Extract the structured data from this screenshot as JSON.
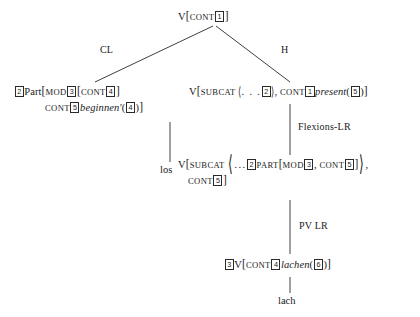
{
  "diagram": {
    "nodes": {
      "root": {
        "id": "root",
        "label": "V[CONT 1]",
        "parts": {
          "cat": "V",
          "open_bracket": "[",
          "cont_label": "CONT",
          "cont_index": "1",
          "close_bracket": "]"
        }
      },
      "left_particle": {
        "id": "left-particle",
        "label": "2 Part[MOD 3 [CONT 4 ] CONT 5 beginnen'(4)]",
        "parts": {
          "index": "2",
          "cat": "Part",
          "open_bracket": "[",
          "mod_label": "MOD",
          "mod_index": "3",
          "inner_open": "[",
          "inner_cont_label": "CONT",
          "inner_cont_index": "4",
          "inner_close": "]",
          "cont_label": "CONT",
          "cont_index": "5",
          "relation": "beginnen'",
          "arg_open": "(",
          "arg_index": "4",
          "arg_close": ")",
          "close_bracket": "]"
        }
      },
      "right_head": {
        "id": "right-head",
        "label": "V[SUBCAT ⟨ . . . 2 ⟩, CONT 1 present(5)]",
        "parts": {
          "cat": "V",
          "open_bracket": "[",
          "subcat_label": "SUBCAT",
          "angle_open": "⟨",
          "ellipsis": ". . .",
          "elem_index": "2",
          "angle_close": "⟩",
          "comma": ",",
          "cont_label": "CONT",
          "cont_index": "1",
          "relation": "present",
          "arg_open": "(",
          "arg_index": "5",
          "arg_close": ")",
          "close_bracket": "]"
        }
      },
      "mid_flex": {
        "id": "mid-flexion",
        "label": "V[SUBCAT ⟨... 2 PART[MOD 3, CONT 5]⟩, CONT 5]",
        "parts": {
          "cat": "V",
          "open_bracket": "[",
          "subcat_label": "SUBCAT",
          "angle_open": "⟨",
          "ellipsis": "...",
          "elem_index": "2",
          "part_label": "PART",
          "part_open": "[",
          "mod_label": "MOD",
          "mod_index": "3",
          "comma1": ",",
          "inner_cont_label": "CONT",
          "inner_cont_index": "5",
          "part_close": "]",
          "angle_close": "⟩",
          "comma2": ",",
          "cont_label": "CONT",
          "cont_index": "5",
          "close_bracket": "]"
        }
      },
      "bottom_verb": {
        "id": "bottom-verb",
        "label": "3 V[CONT 4 lachen(6)]",
        "parts": {
          "index": "3",
          "cat": "V",
          "open_bracket": "[",
          "cont_label": "CONT",
          "cont_index": "4",
          "relation": "lachen",
          "arg_open": "(",
          "arg_index": "6",
          "arg_close": ")",
          "close_bracket": "]"
        }
      }
    },
    "edge_labels": {
      "cl": "CL",
      "h": "H",
      "flexions_lr": "Flexions-LR",
      "pv_lr": "PV LR"
    },
    "terminals": {
      "los": "los",
      "lach": "lach"
    }
  }
}
